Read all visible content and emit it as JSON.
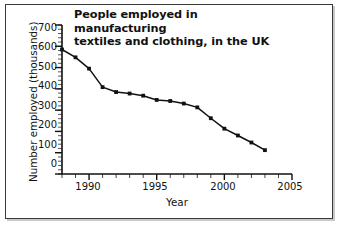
{
  "figure": {
    "title_line1": "People employed in manufacturing",
    "title_line2": "textiles and clothing, in the UK",
    "frame_color": "#3a3a3a",
    "background": "#ffffff",
    "line_color": "#111111",
    "marker_color": "#111111"
  },
  "chart_data": {
    "type": "line",
    "title": "People employed in manufacturing textiles and clothing, in the UK",
    "xlabel": "Year",
    "ylabel": "Number employed (thousands)",
    "xlim": [
      1988,
      2005
    ],
    "ylim": [
      0,
      700
    ],
    "grid": false,
    "legend": "none",
    "x_ticks_major": [
      1990,
      1995,
      2000,
      2005
    ],
    "x_tick_labels": [
      "1990",
      "1995",
      "2000",
      "2005"
    ],
    "x_minor_tick_step": 1,
    "y_ticks_major": [
      0,
      100,
      200,
      300,
      400,
      500,
      600,
      700
    ],
    "y_tick_labels": [
      "0",
      "100",
      "200",
      "300",
      "400",
      "500",
      "600",
      "700"
    ],
    "y_minor_tick_step": 20,
    "x": [
      1988,
      1989,
      1990,
      1991,
      1992,
      1993,
      1994,
      1995,
      1996,
      1997,
      1998,
      1999,
      2000,
      2001,
      2002,
      2003
    ],
    "values": [
      585,
      548,
      495,
      408,
      385,
      378,
      368,
      348,
      343,
      331,
      313,
      262,
      213,
      181,
      148,
      112
    ],
    "series_name": "Number employed (thousands)",
    "units": "thousands of people"
  }
}
